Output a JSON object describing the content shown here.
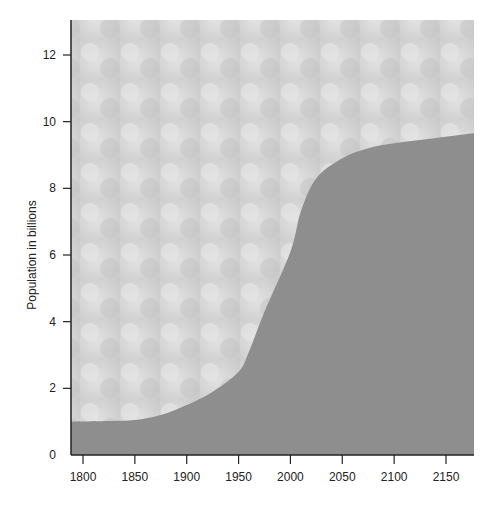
{
  "chart_data": {
    "type": "area",
    "title": "",
    "xlabel": "",
    "ylabel": "Population in billions",
    "x": [
      1800,
      1825,
      1850,
      1875,
      1900,
      1925,
      1950,
      1960,
      1975,
      2000,
      2010,
      2025,
      2050,
      2075,
      2100,
      2125,
      2150,
      2175
    ],
    "values": [
      1.0,
      1.02,
      1.05,
      1.2,
      1.5,
      1.9,
      2.5,
      3.1,
      4.3,
      6.1,
      7.3,
      8.3,
      8.9,
      9.2,
      9.35,
      9.45,
      9.55,
      9.65
    ],
    "xticks": [
      1800,
      1850,
      1900,
      1950,
      2000,
      2050,
      2100,
      2150
    ],
    "yticks": [
      0,
      2,
      4,
      6,
      8,
      10,
      12
    ],
    "xlim": [
      1790,
      2175
    ],
    "ylim": [
      0,
      13
    ],
    "grid": false,
    "legend": "none",
    "colors": {
      "area": "#8e8e8e",
      "background_photo": "#d4d4d4",
      "axis": "#222222"
    }
  }
}
